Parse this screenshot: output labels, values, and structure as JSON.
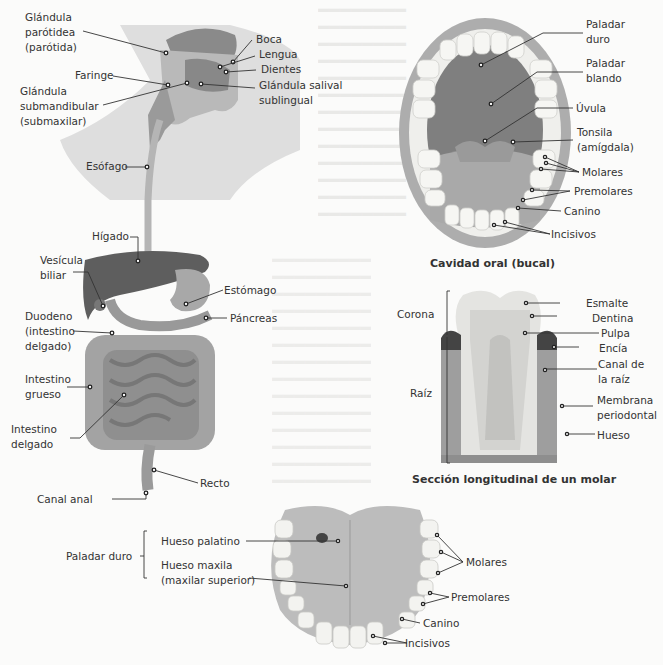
{
  "digestive_system": {
    "labels": {
      "parotid": [
        "Glándula",
        "parótidea",
        "(parótida)"
      ],
      "pharynx": "Faringe",
      "submandibular": [
        "Glándula",
        "submandibular",
        "(submaxilar)"
      ],
      "mouth": "Boca",
      "tongue": "Lengua",
      "teeth": "Dientes",
      "sublingual": [
        "Glándula salival",
        "sublingual"
      ],
      "esophagus": "Esófago",
      "liver": "Hígado",
      "gallbladder": [
        "Vesícula",
        "biliar"
      ],
      "stomach": "Estómago",
      "pancreas": "Páncreas",
      "duodenum": [
        "Duodeno",
        "(intestino",
        "delgado)"
      ],
      "large_intestine": [
        "Intestino",
        "grueso"
      ],
      "small_intestine": [
        "Intestino",
        "delgado"
      ],
      "rectum": "Recto",
      "anal_canal": "Canal anal"
    }
  },
  "oral_cavity": {
    "caption": "Cavidad oral (bucal)",
    "labels": {
      "hard_palate": [
        "Paladar",
        "duro"
      ],
      "soft_palate": [
        "Paladar",
        "blando"
      ],
      "uvula": "Úvula",
      "tonsil": [
        "Tonsila",
        "(amígdala)"
      ],
      "molars": "Molares",
      "premolars": "Premolares",
      "canine": "Canino",
      "incisors": "Incisivos"
    }
  },
  "molar_section": {
    "caption": "Sección longitudinal de un molar",
    "labels": {
      "crown": "Corona",
      "root": "Raíz",
      "enamel": "Esmalte",
      "dentin": "Dentina",
      "pulp": "Pulpa",
      "gum": "Encía",
      "root_canal": [
        "Canal de",
        "la raíz"
      ],
      "periodontal": [
        "Membrana",
        "periodontal"
      ],
      "bone": "Hueso"
    }
  },
  "palate": {
    "labels": {
      "hard_palate": "Paladar duro",
      "palatine_bone": "Hueso palatino",
      "maxilla": [
        "Hueso maxila",
        "(maxilar superior)"
      ],
      "molars": "Molares",
      "premolars": "Premolares",
      "canine": "Canino",
      "incisors": "Incisivos"
    }
  },
  "colors": {
    "neck_shade": "#dcdcdc",
    "organ_dark": "#6d6d6d",
    "organ_mid": "#9a9a9a",
    "tooth": "#f1f1ee",
    "gum": "#bdbdbd",
    "mouth_inner": "#7f7f7f"
  }
}
